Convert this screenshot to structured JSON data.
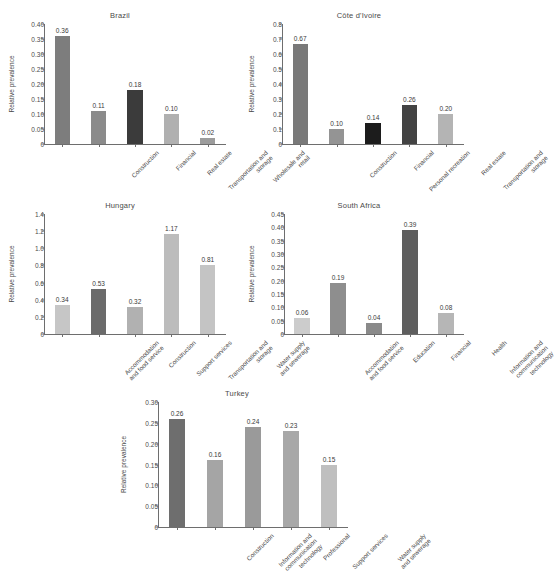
{
  "figure": {
    "ylabel": "Relative prevalence",
    "panels": [
      "Brazil",
      "Côte d'Ivoire",
      "Hungary",
      "South Africa",
      "Turkey"
    ]
  },
  "colors": {
    "very_dark": "#1c1c1c",
    "dark": "#3d3d3d",
    "mid_dark": "#6b6b6b",
    "mid": "#808080",
    "mid_light": "#9a9a9a",
    "light": "#b3b3b3",
    "very_light": "#cfcfcf",
    "axis": "#6e6e6e",
    "text": "#4a4a4a",
    "background": "#ffffff"
  },
  "chart_data": [
    {
      "type": "bar",
      "title": "Brazil",
      "xlabel": "",
      "ylabel": "Relative prevalence",
      "ylim": [
        0,
        0.4
      ],
      "yticks": [
        "0",
        "0.05",
        "0.10",
        "0.15",
        "0.20",
        "0.25",
        "0.30",
        "0.35",
        "0.40"
      ],
      "ytickvalues": [
        0,
        0.05,
        0.1,
        0.15,
        0.2,
        0.25,
        0.3,
        0.35,
        0.4
      ],
      "grid": false,
      "legend": "none",
      "categories": [
        "Construction",
        "Financial",
        "Real estate",
        "Transportation and\nstorage",
        "Wholesale and\nretail"
      ],
      "values": [
        0.36,
        0.11,
        0.18,
        0.1,
        0.02
      ],
      "labels": [
        "0.36",
        "0.11",
        "0.18",
        "0.10",
        "0.02"
      ],
      "barcolors": [
        "#7d7d7d",
        "#8b8b8b",
        "#3b3b3b",
        "#b0b0b0",
        "#9c9c9c"
      ]
    },
    {
      "type": "bar",
      "title": "Côte d'Ivoire",
      "xlabel": "",
      "ylabel": "Relative prevalence",
      "ylim": [
        0,
        0.8
      ],
      "yticks": [
        "0",
        "0.1",
        "0.2",
        "0.3",
        "0.4",
        "0.5",
        "0.6",
        "0.7",
        "0.8"
      ],
      "ytickvalues": [
        0,
        0.1,
        0.2,
        0.3,
        0.4,
        0.5,
        0.6,
        0.7,
        0.8
      ],
      "grid": false,
      "legend": "none",
      "categories": [
        "Construction",
        "Financial",
        "Personal recreation",
        "Real estate",
        "Transportation and\nstorage"
      ],
      "values": [
        0.67,
        0.1,
        0.14,
        0.26,
        0.2
      ],
      "labels": [
        "0.67",
        "0.10",
        "0.14",
        "0.26",
        "0.20"
      ],
      "barcolors": [
        "#797979",
        "#949494",
        "#1c1c1c",
        "#434343",
        "#b4b4b4"
      ]
    },
    {
      "type": "bar",
      "title": "Hungary",
      "xlabel": "",
      "ylabel": "Relative prevalence",
      "ylim": [
        0,
        1.4
      ],
      "yticks": [
        "0",
        "0.2",
        "0.4",
        "0.6",
        "0.8",
        "1.0",
        "1.2",
        "1.4"
      ],
      "ytickvalues": [
        0,
        0.2,
        0.4,
        0.6,
        0.8,
        1.0,
        1.2,
        1.4
      ],
      "grid": false,
      "legend": "none",
      "categories": [
        "Accommodation\nand food service",
        "Construction",
        "Support services",
        "Transportation and\nstorage",
        "Water supply\nand sewerage"
      ],
      "values": [
        0.34,
        0.53,
        0.32,
        1.17,
        0.81
      ],
      "labels": [
        "0.34",
        "0.53",
        "0.32",
        "1.17",
        "0.81"
      ],
      "barcolors": [
        "#c6c6c6",
        "#6b6b6b",
        "#b1b1b1",
        "#bcbcbc",
        "#c4c4c4"
      ]
    },
    {
      "type": "bar",
      "title": "South Africa",
      "xlabel": "",
      "ylabel": "Relative prevalence",
      "ylim": [
        0,
        0.45
      ],
      "yticks": [
        "0",
        "0.05",
        "0.10",
        "0.15",
        "0.20",
        "0.25",
        "0.30",
        "0.35",
        "0.40",
        "0.45"
      ],
      "ytickvalues": [
        0,
        0.05,
        0.1,
        0.15,
        0.2,
        0.25,
        0.3,
        0.35,
        0.4,
        0.45
      ],
      "grid": false,
      "legend": "none",
      "categories": [
        "Accommodation\nand food service",
        "Education",
        "Financial",
        "Health",
        "Information and\ncommunication\ntechnology"
      ],
      "values": [
        0.06,
        0.19,
        0.04,
        0.39,
        0.08
      ],
      "labels": [
        "0.06",
        "0.19",
        "0.04",
        "0.39",
        "0.08"
      ],
      "barcolors": [
        "#cccccc",
        "#8e8e8e",
        "#8a8a8a",
        "#5e5e5e",
        "#b6b6b6"
      ]
    },
    {
      "type": "bar",
      "title": "Turkey",
      "xlabel": "",
      "ylabel": "Relative prevalence",
      "ylim": [
        0,
        0.3
      ],
      "yticks": [
        "0",
        "0.05",
        "0.10",
        "0.15",
        "0.20",
        "0.25",
        "0.30"
      ],
      "ytickvalues": [
        0,
        0.05,
        0.1,
        0.15,
        0.2,
        0.25,
        0.3
      ],
      "grid": false,
      "legend": "none",
      "categories": [
        "Construction",
        "Information and\ncommunication\ntechnology",
        "Professional",
        "Support services",
        "Water supply\nand sewerage"
      ],
      "values": [
        0.26,
        0.16,
        0.24,
        0.23,
        0.15
      ],
      "labels": [
        "0.26",
        "0.16",
        "0.24",
        "0.23",
        "0.15"
      ],
      "barcolors": [
        "#6e6e6e",
        "#a5a5a5",
        "#9a9a9a",
        "#a8a8a8",
        "#bfbfbf"
      ]
    }
  ]
}
